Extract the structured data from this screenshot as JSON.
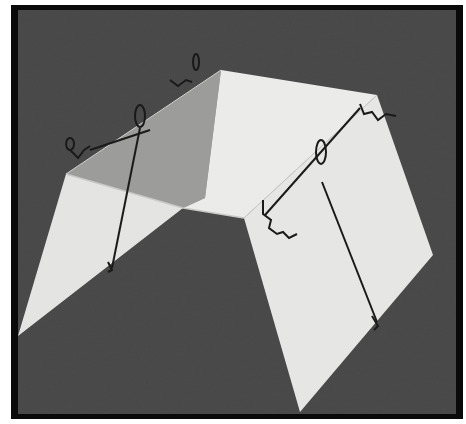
{
  "image": {
    "description": "Black-and-white photograph of a folded white card model forming a table-like shape, held together with bent wire clips, on a dark textured background inside a black frame",
    "colors": {
      "background": "#4a4a4a",
      "frame": "#0a0a0a",
      "margin": "#ffffff",
      "panel_light": "#e8e8e6",
      "panel_shaded": "#9a9a98",
      "wire": "#1a1a1a"
    }
  }
}
